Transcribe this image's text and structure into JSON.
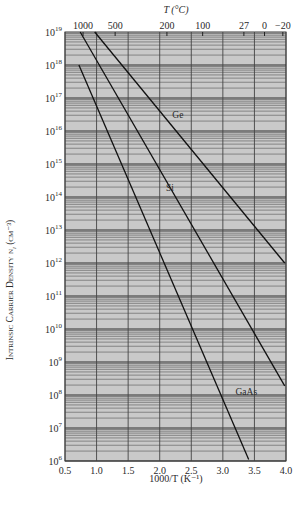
{
  "chart_data": {
    "type": "line",
    "title": "",
    "xlabel": "1000/T (K⁻¹)",
    "ylabel": "Intrinsic Carrier Density n_i (cm⁻³)",
    "top_xlabel": "T (°C)",
    "xlim": [
      0.5,
      4.0
    ],
    "ylim": [
      1000000.0,
      1e+19
    ],
    "yscale": "log",
    "grid": true,
    "x_ticks": [
      "0.5",
      "1.0",
      "1.5",
      "2.0",
      "2.5",
      "3.0",
      "3.5",
      "4.0"
    ],
    "y_ticks": [
      "10^19",
      "10^18",
      "10^17",
      "10^16",
      "10^15",
      "10^14",
      "10^13",
      "10^12",
      "10^11",
      "10^10",
      "10^9",
      "10^8",
      "10^7",
      "10^6"
    ],
    "top_ticks": [
      {
        "label": "1000",
        "x": 0.786
      },
      {
        "label": "500",
        "x": 1.294
      },
      {
        "label": "200",
        "x": 2.114
      },
      {
        "label": "100",
        "x": 2.68
      },
      {
        "label": "27",
        "x": 3.333
      },
      {
        "label": "0",
        "x": 3.66
      },
      {
        "label": "−20",
        "x": 3.95
      }
    ],
    "series": [
      {
        "name": "Ge",
        "points": [
          [
            0.97,
            1e+19
          ],
          [
            3.98,
            1000000000000.0
          ]
        ],
        "label_pos": [
          2.2,
          2.5e+16
        ]
      },
      {
        "name": "Si",
        "points": [
          [
            0.74,
            1e+19
          ],
          [
            3.98,
            190000000.0
          ]
        ],
        "label_pos": [
          2.1,
          150000000000000.0
        ]
      },
      {
        "name": "GaAs",
        "points": [
          [
            0.72,
            1e+18
          ],
          [
            3.41,
            1100000.0
          ]
        ],
        "label_pos": [
          3.2,
          100000000.0
        ]
      }
    ],
    "legend": []
  },
  "labels": {
    "top_axis_title": "T (°C)",
    "bottom_axis_title": "1000/T (K⁻¹)",
    "y_axis_title": "Intrinsic Carrier Density n",
    "y_axis_sub": "i",
    "y_axis_unit": "(cm⁻³)"
  }
}
